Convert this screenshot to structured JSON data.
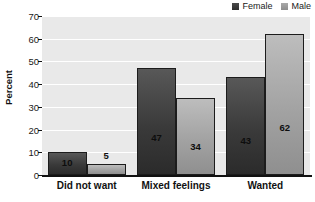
{
  "chart_data": {
    "type": "bar",
    "title": "",
    "xlabel": "",
    "ylabel": "Percent",
    "ylim": [
      0,
      70
    ],
    "yticks": [
      0,
      10,
      20,
      30,
      40,
      50,
      60,
      70
    ],
    "grid": true,
    "legend_position": "top-right",
    "categories": [
      "Did not want",
      "Mixed feelings",
      "Wanted"
    ],
    "series": [
      {
        "name": "Female",
        "color": "#3a3a3a",
        "values": [
          10,
          47,
          43
        ],
        "labels": [
          "10",
          "47",
          "43"
        ],
        "label_placement": [
          "inside",
          "inside",
          "inside"
        ]
      },
      {
        "name": "Male",
        "color": "#a2a2a2",
        "values": [
          5,
          34,
          62
        ],
        "labels": [
          "5",
          "34",
          "62"
        ],
        "label_placement": [
          "above",
          "inside",
          "inside"
        ]
      }
    ]
  },
  "legend": {
    "items": [
      {
        "label": "Female",
        "swatch": "female-swatch"
      },
      {
        "label": "Male",
        "swatch": "male-swatch"
      }
    ]
  },
  "axis": {
    "y_title": "Percent",
    "y_tick_labels": [
      "70",
      "60",
      "50",
      "40",
      "30",
      "20",
      "10",
      "0"
    ],
    "x_tick_labels": [
      "Did not want",
      "Mixed feelings",
      "Wanted"
    ]
  }
}
